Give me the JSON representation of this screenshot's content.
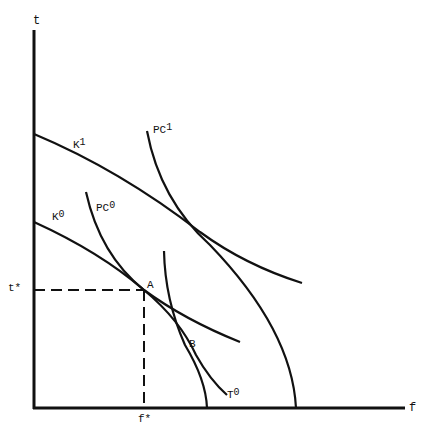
{
  "diagram": {
    "axes": {
      "y_label": "t",
      "x_label": "f",
      "y_tick_label": "t*",
      "x_tick_label": "f*"
    },
    "curves": [
      {
        "id": "K1",
        "base": "K",
        "sup": "1"
      },
      {
        "id": "K0",
        "base": "K",
        "sup": "0"
      },
      {
        "id": "PC1",
        "base": "PC",
        "sup": "1"
      },
      {
        "id": "PC0",
        "base": "PC",
        "sup": "0"
      },
      {
        "id": "T0",
        "base": "T",
        "sup": "0"
      }
    ],
    "points": [
      {
        "id": "A",
        "label": "A"
      },
      {
        "id": "B",
        "label": "B"
      }
    ],
    "line_color": "#111111"
  }
}
